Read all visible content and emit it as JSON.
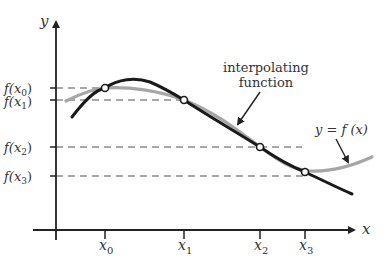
{
  "axes": {
    "x_label": "x",
    "y_label": "y"
  },
  "x_ticks": [
    {
      "base": "x",
      "sub": "0"
    },
    {
      "base": "x",
      "sub": "1"
    },
    {
      "base": "x",
      "sub": "2"
    },
    {
      "base": "x",
      "sub": "3"
    }
  ],
  "y_ticks": [
    {
      "pre": "f(",
      "base": "x",
      "sub": "0",
      "post": ")"
    },
    {
      "pre": "f(",
      "base": "x",
      "sub": "1",
      "post": ")"
    },
    {
      "pre": "f(",
      "base": "x",
      "sub": "2",
      "post": ")"
    },
    {
      "pre": "f(",
      "base": "x",
      "sub": "3",
      "post": ")"
    }
  ],
  "annotations": {
    "interpolating_line1": "interpolating",
    "interpolating_line2": "function",
    "true_function": "y = f (x)"
  },
  "colors": {
    "interpolant": "#1a1a1a",
    "true_function": "#a6a6a6",
    "dashed": "#8c8c8c",
    "axis": "#222222"
  }
}
